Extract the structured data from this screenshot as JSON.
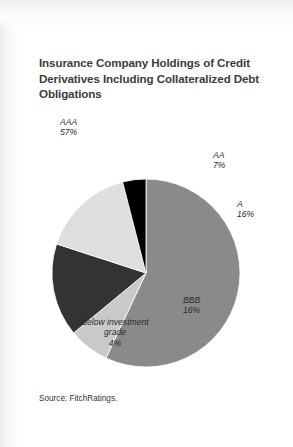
{
  "card": {
    "title": "Insurance Company Holdings of Credit Derivatives Including Collateralized Debt Obligations",
    "source": "Source: FitchRatings."
  },
  "labels": {
    "aaa": {
      "name": "AAA",
      "value": "57%"
    },
    "aa": {
      "name": "AA",
      "value": "7%"
    },
    "a": {
      "name": "A",
      "value": "16%"
    },
    "bbb": {
      "name": "BBB",
      "value": "16%"
    },
    "big": {
      "line1": "Below  investment",
      "line2": "grade",
      "value": "4%"
    }
  },
  "chart_data": {
    "type": "pie",
    "title": "Insurance Company Holdings of Credit Derivatives Including Collateralized Debt Obligations",
    "source": "Source: FitchRatings.",
    "categories": [
      "AAA",
      "AA",
      "A",
      "BBB",
      "Below investment grade"
    ],
    "values": [
      57,
      7,
      16,
      16,
      4
    ],
    "unit": "percent",
    "total": 100,
    "start_angle_deg": 0,
    "direction": "clockwise",
    "legend": "none-inline-labels",
    "colors": [
      "#8a8a8a",
      "#c9c9c9",
      "#333333",
      "#dedede",
      "#000000"
    ],
    "slices": [
      {
        "label": "AAA",
        "value": 57,
        "display": "57%",
        "color": "#8a8a8a"
      },
      {
        "label": "AA",
        "value": 7,
        "display": "7%",
        "color": "#c9c9c9"
      },
      {
        "label": "A",
        "value": 16,
        "display": "16%",
        "color": "#333333"
      },
      {
        "label": "BBB",
        "value": 16,
        "display": "16%",
        "color": "#dedede"
      },
      {
        "label": "Below investment grade",
        "value": 4,
        "display": "4%",
        "color": "#000000"
      }
    ]
  },
  "geometry": {
    "cx": 121,
    "cy": 178,
    "r": 94
  }
}
